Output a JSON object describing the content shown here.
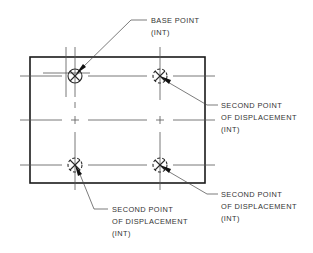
{
  "drawing": {
    "title": "Move/copy displacement diagram",
    "plate": {
      "x": 30,
      "y": 57,
      "width": 175,
      "height": 126
    },
    "centerlines": {
      "rows_y": [
        76,
        120,
        165
      ],
      "cols_x": [
        75,
        160
      ]
    },
    "points": [
      {
        "id": "base",
        "cx": 75,
        "cy": 76,
        "style": "solid"
      },
      {
        "id": "second-top-right",
        "cx": 160,
        "cy": 76,
        "style": "dashed"
      },
      {
        "id": "second-bottom-left",
        "cx": 75,
        "cy": 165,
        "style": "dashed"
      },
      {
        "id": "second-bottom-right",
        "cx": 160,
        "cy": 165,
        "style": "dashed"
      }
    ],
    "labels": {
      "base_point": {
        "line1": "BASE POINT",
        "line2": "(INT)"
      },
      "second_top_right": {
        "line1": "SECOND POINT",
        "line2": "OF DISPLACEMENT",
        "line3": "(INT)"
      },
      "second_bottom_right": {
        "line1": "SECOND POINT",
        "line2": "OF DISPLACEMENT",
        "line3": "(INT)"
      },
      "second_bottom_left": {
        "line1": "SECOND POINT",
        "line2": "OF DISPLACEMENT",
        "line3": "(INT)"
      }
    },
    "colors": {
      "line": "#1a1a1a",
      "text": "#333333",
      "background": "#ffffff"
    }
  }
}
